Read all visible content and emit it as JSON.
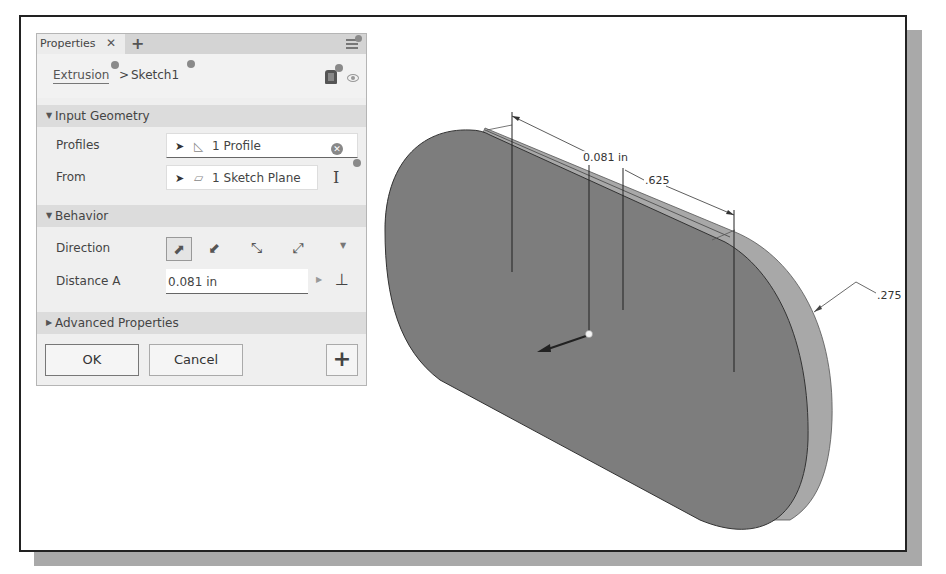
{
  "panel": {
    "tab_label": "Properties",
    "tab_close": "✕",
    "tab_add": "+",
    "breadcrumb": {
      "feature": "Extrusion",
      "separator": ">",
      "sketch": "Sketch1"
    },
    "sections": {
      "input_geometry": {
        "label": "Input Geometry",
        "expanded_glyph": "▼"
      },
      "behavior": {
        "label": "Behavior",
        "expanded_glyph": "▼"
      },
      "advanced": {
        "label": "Advanced Properties",
        "collapsed_glyph": "▶"
      }
    },
    "rows": {
      "profiles": {
        "label": "Profiles",
        "value": "1 Profile",
        "icon": "profile-region-icon"
      },
      "from": {
        "label": "From",
        "value": "1 Sketch Plane",
        "icon": "sketch-plane-icon"
      },
      "direction": {
        "label": "Direction",
        "options": [
          "default",
          "flipped",
          "symmetric",
          "asymmetric"
        ],
        "selected": "default"
      },
      "distance_a": {
        "label": "Distance A",
        "value": "0.081 in"
      }
    },
    "buttons": {
      "ok": "OK",
      "cancel": "Cancel",
      "plus": "+"
    }
  },
  "viewport": {
    "dimensions": {
      "extrude_distance": "0.081 in",
      "length": ".625",
      "radius": ".275"
    },
    "colors": {
      "face": "#7a7a7a",
      "side": "#a8a8a8",
      "frame_shadow": "#a9a9a9"
    }
  }
}
